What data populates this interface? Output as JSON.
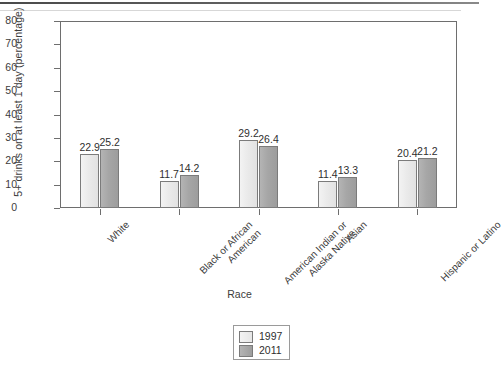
{
  "chart_data": {
    "type": "bar",
    "title": "",
    "xlabel": "Race",
    "ylabel": "5+ drinks on at least 1 day (percentage)",
    "ylim": [
      0,
      80
    ],
    "yticks": [
      "0",
      "10",
      "20",
      "30",
      "40",
      "50",
      "60",
      "70",
      "80"
    ],
    "grid": false,
    "legend_position": "bottom-center",
    "categories": [
      "White",
      "Black or African\nAmerican",
      "American Indian or\nAlaska Native",
      "Asian",
      "Hispanic or Latino"
    ],
    "series": [
      {
        "name": "1997",
        "color": "#e8e8e8",
        "values": [
          22.9,
          11.7,
          29.2,
          11.4,
          20.4
        ]
      },
      {
        "name": "2011",
        "color": "#a6a6a6",
        "values": [
          25.2,
          14.2,
          26.4,
          13.3,
          21.2
        ]
      }
    ]
  },
  "legend": {
    "items": [
      {
        "label": "1997"
      },
      {
        "label": "2011"
      }
    ]
  }
}
